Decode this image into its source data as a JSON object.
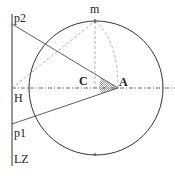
{
  "diagram": {
    "labels": {
      "p2": "p2",
      "m": "m",
      "C": "C",
      "A": "A",
      "H": "H",
      "p1": "p1",
      "LZ": "LZ"
    },
    "colors": {
      "stroke": "#333333",
      "dashed": "#888888",
      "hatch": "#555555",
      "background": "#ffffff"
    }
  }
}
